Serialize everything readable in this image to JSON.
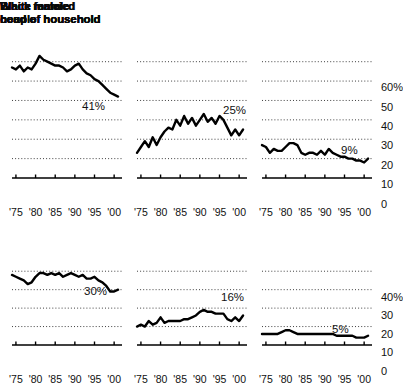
{
  "figure": {
    "width": 399,
    "height": 374,
    "background": "#ffffff",
    "ink": "#000000",
    "gridline_style": "dotted",
    "x_tick_labels": [
      "'75",
      "'80",
      "'85",
      "'90",
      "'95",
      "'00"
    ]
  },
  "chart_data": [
    {
      "id": "black-female",
      "type": "line",
      "title": "Black female\nhead of household",
      "xlabel": "",
      "ylabel": "",
      "xlim": [
        1974,
        2002
      ],
      "ylim": [
        0,
        65
      ],
      "yticks": [
        10,
        20,
        30,
        40,
        50,
        60
      ],
      "ytick_labels": [
        "",
        "",
        "",
        "",
        "",
        ""
      ],
      "xticks": [
        1975,
        1980,
        1985,
        1990,
        1995,
        2000
      ],
      "tick_labels": [
        "'75",
        "'80",
        "'85",
        "'90",
        "'95",
        "'00"
      ],
      "grid": true,
      "legend": "none",
      "annotation": "41%",
      "x": [
        1974,
        1975,
        1976,
        1977,
        1978,
        1979,
        1980,
        1981,
        1982,
        1983,
        1984,
        1985,
        1986,
        1987,
        1988,
        1989,
        1990,
        1991,
        1992,
        1993,
        1994,
        1995,
        1996,
        1997,
        1998,
        1999,
        2000,
        2001
      ],
      "values": [
        57,
        56,
        58,
        55,
        57,
        56,
        59,
        63,
        61,
        60,
        59,
        58,
        58,
        57,
        55,
        56,
        58,
        59,
        56,
        54,
        53,
        51,
        50,
        48,
        46,
        44,
        43,
        42
      ]
    },
    {
      "id": "black-male",
      "type": "line",
      "title": "Black male\nhead of household",
      "xlabel": "",
      "ylabel": "",
      "xlim": [
        1974,
        2002
      ],
      "ylim": [
        0,
        65
      ],
      "yticks": [
        10,
        20,
        30,
        40,
        50,
        60
      ],
      "ytick_labels": [
        "",
        "",
        "",
        "",
        "",
        ""
      ],
      "xticks": [
        1975,
        1980,
        1985,
        1990,
        1995,
        2000
      ],
      "tick_labels": [
        "'75",
        "'80",
        "'85",
        "'90",
        "'95",
        "'00"
      ],
      "grid": true,
      "legend": "none",
      "annotation": "25%",
      "x": [
        1974,
        1975,
        1976,
        1977,
        1978,
        1979,
        1980,
        1981,
        1982,
        1983,
        1984,
        1985,
        1986,
        1987,
        1988,
        1989,
        1990,
        1991,
        1992,
        1993,
        1994,
        1995,
        1996,
        1997,
        1998,
        1999,
        2000,
        2001
      ],
      "values": [
        13,
        16,
        19,
        16,
        21,
        17,
        21,
        24,
        26,
        25,
        30,
        27,
        32,
        28,
        31,
        27,
        30,
        33,
        29,
        31,
        28,
        32,
        30,
        26,
        22,
        25,
        22,
        25
      ]
    },
    {
      "id": "black-married",
      "type": "line",
      "title": "Black married\ncouple",
      "xlabel": "",
      "ylabel": "",
      "xlim": [
        1974,
        2002
      ],
      "ylim": [
        0,
        65
      ],
      "yticks": [
        10,
        20,
        30,
        40,
        50,
        60
      ],
      "ytick_labels": [
        "10",
        "20",
        "30",
        "40",
        "50",
        "60%"
      ],
      "xticks": [
        1975,
        1980,
        1985,
        1990,
        1995,
        2000
      ],
      "tick_labels": [
        "'75",
        "'80",
        "'85",
        "'90",
        "'95",
        "'00"
      ],
      "grid": true,
      "legend": "none",
      "annotation": "9%",
      "x": [
        1974,
        1975,
        1976,
        1977,
        1978,
        1979,
        1980,
        1981,
        1982,
        1983,
        1984,
        1985,
        1986,
        1987,
        1988,
        1989,
        1990,
        1991,
        1992,
        1993,
        1994,
        1995,
        1996,
        1997,
        1998,
        1999,
        2000,
        2001
      ],
      "values": [
        17,
        16,
        13,
        15,
        14,
        14,
        16,
        18,
        18,
        17,
        13,
        12,
        13,
        13,
        12,
        14,
        12,
        15,
        13,
        12,
        11,
        11,
        10,
        10,
        9,
        9,
        8,
        10
      ]
    },
    {
      "id": "white-female",
      "type": "line",
      "title": "White female\nhead of household",
      "xlabel": "",
      "ylabel": "",
      "xlim": [
        1974,
        2002
      ],
      "ylim": [
        0,
        45
      ],
      "yticks": [
        10,
        20,
        30,
        40
      ],
      "ytick_labels": [
        "",
        "",
        "",
        ""
      ],
      "xticks": [
        1975,
        1980,
        1985,
        1990,
        1995,
        2000
      ],
      "tick_labels": [
        "'75",
        "'80",
        "'85",
        "'90",
        "'95",
        "'00"
      ],
      "grid": true,
      "legend": "none",
      "annotation": "30%",
      "x": [
        1974,
        1975,
        1976,
        1977,
        1978,
        1979,
        1980,
        1981,
        1982,
        1983,
        1984,
        1985,
        1986,
        1987,
        1988,
        1989,
        1990,
        1991,
        1992,
        1993,
        1994,
        1995,
        1996,
        1997,
        1998,
        1999,
        2000,
        2001
      ],
      "values": [
        38,
        37,
        36,
        35,
        33,
        34,
        37,
        39,
        39,
        38,
        39,
        38,
        39,
        37,
        38,
        39,
        38,
        37,
        38,
        36,
        36,
        37,
        35,
        34,
        32,
        29,
        29,
        30
      ]
    },
    {
      "id": "white-male",
      "type": "line",
      "title": "White male\nhead of household",
      "xlabel": "",
      "ylabel": "",
      "xlim": [
        1974,
        2002
      ],
      "ylim": [
        0,
        45
      ],
      "yticks": [
        10,
        20,
        30,
        40
      ],
      "ytick_labels": [
        "",
        "",
        "",
        ""
      ],
      "xticks": [
        1975,
        1980,
        1985,
        1990,
        1995,
        2000
      ],
      "tick_labels": [
        "'75",
        "'80",
        "'85",
        "'90",
        "'95",
        "'00"
      ],
      "grid": true,
      "legend": "none",
      "annotation": "16%",
      "x": [
        1974,
        1975,
        1976,
        1977,
        1978,
        1979,
        1980,
        1981,
        1982,
        1983,
        1984,
        1985,
        1986,
        1987,
        1988,
        1989,
        1990,
        1991,
        1992,
        1993,
        1994,
        1995,
        1996,
        1997,
        1998,
        1999,
        2000,
        2001
      ],
      "values": [
        10,
        11,
        10,
        13,
        11,
        12,
        15,
        12,
        13,
        13,
        13,
        13,
        14,
        14,
        15,
        16,
        18,
        19,
        18,
        18,
        17,
        17,
        17,
        14,
        13,
        15,
        13,
        16
      ]
    },
    {
      "id": "white-married",
      "type": "line",
      "title": "White married\ncouple",
      "xlabel": "",
      "ylabel": "",
      "xlim": [
        1974,
        2002
      ],
      "ylim": [
        0,
        45
      ],
      "yticks": [
        10,
        20,
        30,
        40
      ],
      "ytick_labels": [
        "10",
        "20",
        "30",
        "40%"
      ],
      "xticks": [
        1975,
        1980,
        1985,
        1990,
        1995,
        2000
      ],
      "tick_labels": [
        "'75",
        "'80",
        "'85",
        "'90",
        "'95",
        "'00"
      ],
      "grid": true,
      "legend": "none",
      "annotation": "5%",
      "x": [
        1974,
        1975,
        1976,
        1977,
        1978,
        1979,
        1980,
        1981,
        1982,
        1983,
        1984,
        1985,
        1986,
        1987,
        1988,
        1989,
        1990,
        1991,
        1992,
        1993,
        1994,
        1995,
        1996,
        1997,
        1998,
        1999,
        2000,
        2001
      ],
      "values": [
        6,
        6,
        6,
        6,
        6,
        7,
        8,
        8,
        7,
        6,
        6,
        6,
        6,
        6,
        6,
        6,
        6,
        6,
        6,
        5,
        5,
        5,
        5,
        5,
        4,
        4,
        4,
        5
      ]
    }
  ]
}
